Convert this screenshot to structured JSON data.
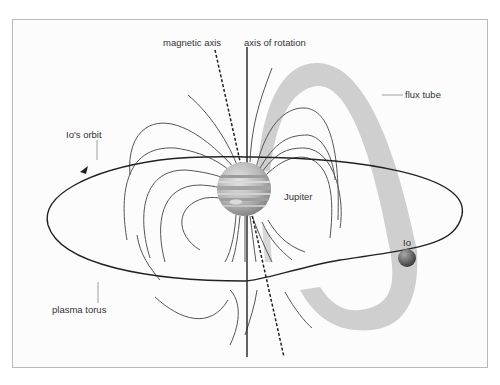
{
  "diagram": {
    "type": "magnetosphere-schematic",
    "labels": {
      "magnetic_axis": "magnetic axis",
      "axis_of_rotation": "axis of rotation",
      "flux_tube": "flux tube",
      "io_orbit": "Io's orbit",
      "jupiter": "Jupiter",
      "io": "Io",
      "plasma_torus": "plasma torus"
    },
    "colors": {
      "background": "#fcfcfc",
      "frame": "#b9b9b9",
      "flux_tube": "#cfcfcf",
      "field_lines": "#555555",
      "orbit": "#222222",
      "jupiter_base": "#b8b8b8",
      "io_base": "#6a6a6a"
    },
    "nodes": [
      {
        "id": "jupiter",
        "label": "Jupiter",
        "shape": "sphere",
        "position": "center"
      },
      {
        "id": "io",
        "label": "Io",
        "shape": "sphere",
        "position": "right, on orbit"
      },
      {
        "id": "flux_tube",
        "label": "flux tube",
        "shape": "arched band"
      },
      {
        "id": "io_orbit",
        "label": "Io's orbit",
        "shape": "ellipse",
        "direction": "counter-clockwise arrow on left"
      },
      {
        "id": "plasma_torus",
        "label": "plasma torus",
        "shape": "ring (implied)"
      },
      {
        "id": "magnetic_axis",
        "label": "magnetic axis",
        "shape": "dashed tilted line"
      },
      {
        "id": "axis_of_rotation",
        "label": "axis of rotation",
        "shape": "solid vertical line"
      }
    ],
    "edges": [
      {
        "from": "io",
        "to": "jupiter",
        "via": "flux_tube"
      }
    ]
  }
}
